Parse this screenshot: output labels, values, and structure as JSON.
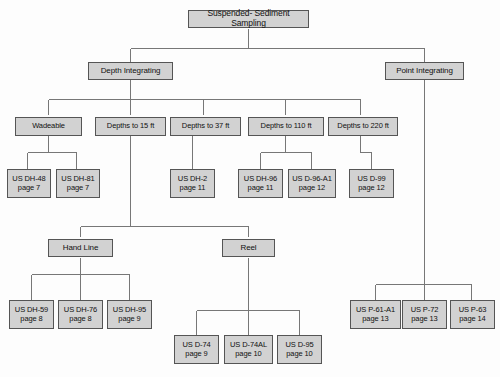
{
  "diagram": {
    "type": "tree-flowchart",
    "colors": {
      "node_fill": "#d2d2d2",
      "node_border": "#555555",
      "connector": "#777777",
      "background": "#fdfdfd",
      "text": "#111111"
    },
    "nodes": {
      "root": {
        "label": "Suspended- Sediment Sampling"
      },
      "depth_integrating": {
        "label": "Depth Integrating"
      },
      "point_integrating": {
        "label": "Point Integrating"
      },
      "wadeable": {
        "label": "Wadeable"
      },
      "depths_15": {
        "label": "Depths to 15 ft"
      },
      "depths_37": {
        "label": "Depths to 37 ft"
      },
      "depths_110": {
        "label": "Depths to 110 ft"
      },
      "depths_220": {
        "label": "Depths to 220 ft"
      },
      "hand_line": {
        "label": "Hand Line"
      },
      "reel": {
        "label": "Reel"
      },
      "dh48": {
        "name": "US DH-48",
        "page": "page 7"
      },
      "dh81": {
        "name": "US DH-81",
        "page": "page 7"
      },
      "dh2": {
        "name": "US DH-2",
        "page": "page 11"
      },
      "dh96": {
        "name": "US DH-96",
        "page": "page 11"
      },
      "d96a1": {
        "name": "US D-96-A1",
        "page": "page 12"
      },
      "d99": {
        "name": "US D-99",
        "page": "page 12"
      },
      "dh59": {
        "name": "US DH-59",
        "page": "page 8"
      },
      "dh76": {
        "name": "US DH-76",
        "page": "page 8"
      },
      "dh95": {
        "name": "US DH-95",
        "page": "page 9"
      },
      "d74": {
        "name": "US D-74",
        "page": "page 9"
      },
      "d74al": {
        "name": "US D-74AL",
        "page": "page 10"
      },
      "d95": {
        "name": "US D-95",
        "page": "page 10"
      },
      "p61a1": {
        "name": "US P-61-A1",
        "page": "page 13"
      },
      "p72": {
        "name": "US P-72",
        "page": "page 13"
      },
      "p63": {
        "name": "US P-63",
        "page": "page 14"
      }
    }
  }
}
